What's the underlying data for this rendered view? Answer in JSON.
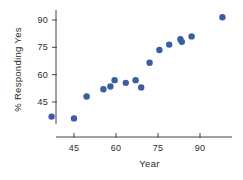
{
  "chart_data": {
    "type": "scatter",
    "title": "",
    "xlabel": "Year",
    "ylabel": "% Responding Yes",
    "xlim": [
      33,
      103
    ],
    "ylim": [
      30,
      97
    ],
    "xticks": [
      45,
      60,
      75,
      90
    ],
    "yticks": [
      45,
      60,
      75,
      90
    ],
    "xtick_labels": [
      "45",
      "60",
      "75",
      "90"
    ],
    "ytick_labels": [
      "45",
      "60",
      "75",
      "90"
    ],
    "grid": false,
    "legend": null,
    "marker": {
      "shape": "circle",
      "color": "#3a5da4",
      "size_px": 4.2
    },
    "axis_color": "#444444",
    "background": "#ffffff",
    "points": [
      {
        "x": 37.0,
        "y": 37.0
      },
      {
        "x": 45.0,
        "y": 36.0
      },
      {
        "x": 49.5,
        "y": 48.0
      },
      {
        "x": 55.5,
        "y": 52.0
      },
      {
        "x": 58.0,
        "y": 53.5
      },
      {
        "x": 59.5,
        "y": 57.0
      },
      {
        "x": 63.5,
        "y": 55.5
      },
      {
        "x": 67.0,
        "y": 57.0
      },
      {
        "x": 69.0,
        "y": 53.0
      },
      {
        "x": 72.0,
        "y": 66.5
      },
      {
        "x": 75.5,
        "y": 73.5
      },
      {
        "x": 79.0,
        "y": 76.5
      },
      {
        "x": 83.0,
        "y": 79.5
      },
      {
        "x": 83.5,
        "y": 78.0
      },
      {
        "x": 87.0,
        "y": 81.0
      },
      {
        "x": 98.0,
        "y": 91.5
      }
    ]
  },
  "axis_titles": {
    "x": "Year",
    "y": "% Responding Yes"
  }
}
